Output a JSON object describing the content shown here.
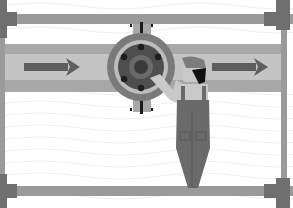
{
  "illustration": {
    "subject": "worker adjusting pipe valve",
    "colors": {
      "background": "#ffffff",
      "wave_lines": "#f0f0f0",
      "frame": "#9a9a9a",
      "frame_dark": "#6f6f6f",
      "pipe_outer": "#a8a8a8",
      "pipe_inner": "#c4c4c4",
      "arrow": "#5e5e5e",
      "valve_ring": "#7a7a7a",
      "valve_body": "#4e4e4e",
      "valve_hub": "#6a6a6a",
      "bolt": "#1e1e1e",
      "skin": "#c9c9c9",
      "cap": "#7d7d7d",
      "hair": "#111111",
      "overalls": "#6a6a6a"
    },
    "arrows": [
      {
        "direction": "right",
        "x": 24,
        "y": 66
      },
      {
        "direction": "right",
        "x": 212,
        "y": 66
      }
    ]
  }
}
